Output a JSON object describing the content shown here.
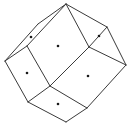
{
  "diagram": {
    "type": "rhombic-dodecahedron-line-drawing",
    "colors": {
      "stroke": "#3a3a3a",
      "dot": "#1a1a1a",
      "background": "#ffffff"
    },
    "vertices": {
      "top": [
        66,
        4
      ],
      "upper_left_outer": [
        38,
        24
      ],
      "left": [
        5,
        61
      ],
      "inner_left": [
        27,
        46
      ],
      "right_top": [
        107,
        27
      ],
      "right": [
        126,
        65
      ],
      "center": [
        89,
        47
      ],
      "center_low": [
        50,
        86
      ],
      "bottom_left": [
        28,
        102
      ],
      "bottom": [
        66,
        122
      ],
      "bottom_right": [
        87,
        108
      ]
    },
    "faces": [
      {
        "name": "upper-left-thin-face",
        "dot": [
          31,
          37
        ]
      },
      {
        "name": "top-center-face",
        "dot": [
          58,
          46
        ]
      },
      {
        "name": "top-right-face",
        "dot": [
          99,
          36
        ]
      },
      {
        "name": "left-face",
        "dot": [
          27,
          73
        ]
      },
      {
        "name": "center-right-face",
        "dot": [
          88,
          76
        ]
      },
      {
        "name": "bottom-face",
        "dot": [
          58,
          104
        ]
      }
    ]
  }
}
